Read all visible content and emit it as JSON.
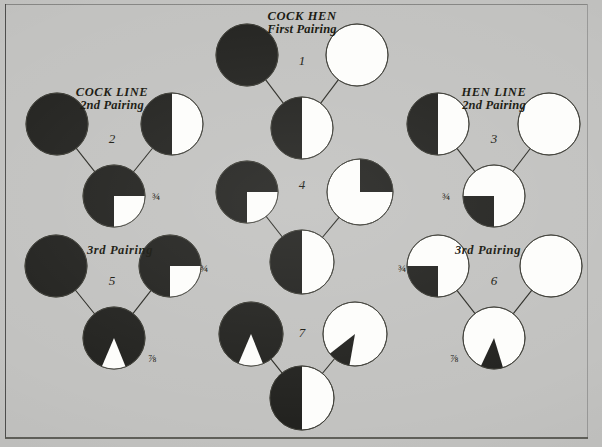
{
  "figure": {
    "background_color": "#c2c2c0",
    "ink_color": "#1a1a12",
    "black_fill": "#232320",
    "white_fill": "#fdfdfb"
  },
  "headings": [
    {
      "id": "cock-hen",
      "line1": "COCK HEN",
      "line2": "First Pairing",
      "x": 302,
      "y": 10
    },
    {
      "id": "cock-line",
      "line1": "COCK LINE",
      "line2": "2nd Pairing",
      "x": 112,
      "y": 86
    },
    {
      "id": "hen-line",
      "line1": "HEN LINE",
      "line2": "2nd Pairing",
      "x": 494,
      "y": 86
    },
    {
      "id": "cock-3rd",
      "line1": "3rd Pairing",
      "line2": "",
      "x": 120,
      "y": 244
    },
    {
      "id": "hen-3rd",
      "line1": "3rd Pairing",
      "line2": "",
      "x": 488,
      "y": 244
    }
  ],
  "pairings": [
    {
      "number": "1",
      "label_x": 302,
      "label_y": 62,
      "cock": {
        "cx": 247,
        "cy": 55,
        "r": 31,
        "pattern": "full-black",
        "desc": "solid black cock"
      },
      "hen": {
        "cx": 357,
        "cy": 55,
        "r": 31,
        "pattern": "full-white",
        "desc": "solid white hen"
      },
      "offspring": {
        "cx": 302,
        "cy": 128,
        "r": 31,
        "pattern": "half-left-black",
        "desc": "one half black one half white",
        "fraction": ""
      }
    },
    {
      "number": "2",
      "label_x": 112,
      "label_y": 140,
      "cock": {
        "cx": 57,
        "cy": 124,
        "r": 31,
        "pattern": "full-black",
        "desc": "solid black cock"
      },
      "hen": {
        "cx": 172,
        "cy": 124,
        "r": 31,
        "pattern": "half-left-black",
        "desc": "half black half white hen"
      },
      "offspring": {
        "cx": 114,
        "cy": 196,
        "r": 31,
        "pattern": "quarter-white-br",
        "desc": "three quarters black, white quarter lower right",
        "fraction": "¾",
        "frac_x": 152,
        "frac_y": 190
      }
    },
    {
      "number": "3",
      "label_x": 494,
      "label_y": 140,
      "cock": {
        "cx": 438,
        "cy": 124,
        "r": 31,
        "pattern": "half-left-black",
        "desc": "half black half white cock"
      },
      "hen": {
        "cx": 549,
        "cy": 124,
        "r": 31,
        "pattern": "full-white",
        "desc": "solid white hen"
      },
      "offspring": {
        "cx": 494,
        "cy": 196,
        "r": 31,
        "pattern": "quarter-black-bl",
        "desc": "three quarters white, black quarter lower left",
        "fraction": "¾",
        "frac_x": 442,
        "frac_y": 190
      }
    },
    {
      "number": "4",
      "label_x": 302,
      "label_y": 186,
      "cock": {
        "cx": 247,
        "cy": 192,
        "r": 31,
        "pattern": "quarter-white-br",
        "desc": "three quarters black, white quarter lower right"
      },
      "hen": {
        "cx": 360,
        "cy": 192,
        "r": 33,
        "pattern": "quarter-black-tr",
        "desc": "three quarters white, black quarter upper right"
      },
      "offspring": {
        "cx": 302,
        "cy": 262,
        "r": 32,
        "pattern": "half-left-black",
        "desc": "one half black one half white",
        "fraction": ""
      }
    },
    {
      "number": "5",
      "label_x": 112,
      "label_y": 282,
      "cock": {
        "cx": 56,
        "cy": 266,
        "r": 31,
        "pattern": "full-black",
        "desc": "solid black cock"
      },
      "hen": {
        "cx": 170,
        "cy": 266,
        "r": 31,
        "pattern": "quarter-white-br",
        "desc": "three quarters black, white quarter lower right",
        "fraction": "¾",
        "frac_x": 200,
        "frac_y": 262
      },
      "offspring": {
        "cx": 114,
        "cy": 338,
        "r": 31,
        "pattern": "wedge-white-down",
        "desc": "seven eighths black, narrow white wedge at bottom",
        "fraction": "⅞",
        "frac_x": 148,
        "frac_y": 352
      }
    },
    {
      "number": "6",
      "label_x": 494,
      "label_y": 282,
      "cock": {
        "cx": 438,
        "cy": 266,
        "r": 31,
        "pattern": "quarter-black-bl",
        "desc": "three quarters white, black quarter lower left",
        "fraction": "¾",
        "frac_x": 398,
        "frac_y": 262
      },
      "hen": {
        "cx": 551,
        "cy": 266,
        "r": 31,
        "pattern": "full-white",
        "desc": "solid white hen"
      },
      "offspring": {
        "cx": 494,
        "cy": 338,
        "r": 31,
        "pattern": "wedge-black-down",
        "desc": "seven eighths white, narrow black wedge at bottom",
        "fraction": "⅞",
        "frac_x": 450,
        "frac_y": 352
      }
    },
    {
      "number": "7",
      "label_x": 302,
      "label_y": 334,
      "cock": {
        "cx": 251,
        "cy": 334,
        "r": 32,
        "pattern": "wedge-white-down",
        "desc": "seven eighths black, narrow white wedge at bottom"
      },
      "hen": {
        "cx": 355,
        "cy": 334,
        "r": 32,
        "pattern": "wedge-black-downleft",
        "desc": "seven eighths white, narrow black wedge lower left"
      },
      "offspring": {
        "cx": 302,
        "cy": 398,
        "r": 32,
        "pattern": "half-left-black",
        "desc": "one half black one half white",
        "fraction": ""
      }
    }
  ]
}
